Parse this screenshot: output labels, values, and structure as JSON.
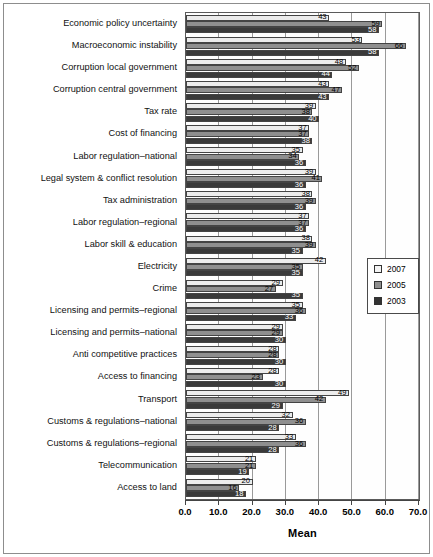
{
  "figure": {
    "axis_title": "Mean",
    "legend_title": ""
  },
  "chart_data": {
    "type": "bar",
    "orientation": "horizontal",
    "title": "",
    "subtitle": "",
    "xlabel": "Mean",
    "ylabel": "",
    "xlim": [
      0.0,
      70.0
    ],
    "xticks": [
      "0.0",
      "10.0",
      "20.0",
      "30.0",
      "40.0",
      "50.0",
      "60.0",
      "70.0"
    ],
    "xtick_values": [
      0,
      10,
      20,
      30,
      40,
      50,
      60,
      70
    ],
    "grid": true,
    "grid_axis": "x",
    "legend_position": "right-middle",
    "legend": [
      "2007",
      "2005",
      "2003"
    ],
    "series_colors": {
      "2007": "#ececec",
      "2005": "#8f8f8f",
      "2003": "#3a3a3a"
    },
    "categories": [
      "Economic policy uncertainty",
      "Macroeconomic instability",
      "Corruption local government",
      "Corruption central government",
      "Tax rate",
      "Cost of financing",
      "Labor regulation–national",
      "Legal system & conflict resolution",
      "Tax administration",
      "Labor regulation–regional",
      "Labor skill & education",
      "Electricity",
      "Crime",
      "Licensing and permits–regional",
      "Licensing and permits–national",
      "Anti competitive practices",
      "Access to financing",
      "Transport",
      "Customs & regulations–national",
      "Customs & regulations–regional",
      "Telecommunication",
      "Access to land"
    ],
    "series": [
      {
        "name": "2007",
        "values": [
          43,
          53,
          48,
          43,
          39,
          37,
          35,
          39,
          38,
          37,
          38,
          42,
          29,
          35,
          29,
          28,
          28,
          49,
          32,
          33,
          21,
          20
        ]
      },
      {
        "name": "2005",
        "values": [
          59,
          66,
          52,
          47,
          38,
          37,
          34,
          41,
          39,
          37,
          39,
          35,
          27,
          36,
          29,
          28,
          23,
          42,
          36,
          36,
          21,
          16
        ]
      },
      {
        "name": "2003",
        "values": [
          58,
          58,
          44,
          43,
          40,
          38,
          36,
          36,
          36,
          36,
          35,
          35,
          35,
          33,
          30,
          30,
          30,
          29,
          28,
          28,
          19,
          18
        ]
      }
    ]
  }
}
